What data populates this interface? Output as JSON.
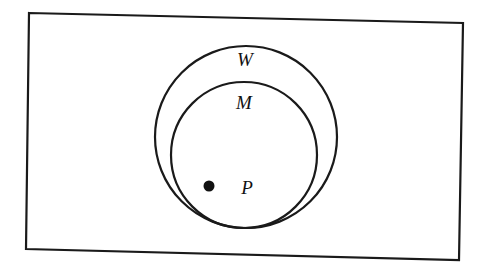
{
  "diagram": {
    "type": "euler",
    "frame": {
      "points": "29,13 463,23 459,260 26,249"
    },
    "sets": [
      {
        "id": "W",
        "label": "W",
        "cx": 246,
        "cy": 137,
        "r": 91,
        "label_x": 245,
        "label_y": 66
      },
      {
        "id": "M",
        "label": "M",
        "cx": 244,
        "cy": 155,
        "r": 73,
        "label_x": 244,
        "label_y": 109
      }
    ],
    "points": [
      {
        "id": "P",
        "label": "P",
        "x": 209,
        "y": 186,
        "label_x": 247,
        "label_y": 194
      }
    ],
    "relationships": [
      "M is a subset of W",
      "P is an element of M"
    ],
    "colors": {
      "stroke": "#1a1a1a",
      "background": "#ffffff"
    }
  }
}
